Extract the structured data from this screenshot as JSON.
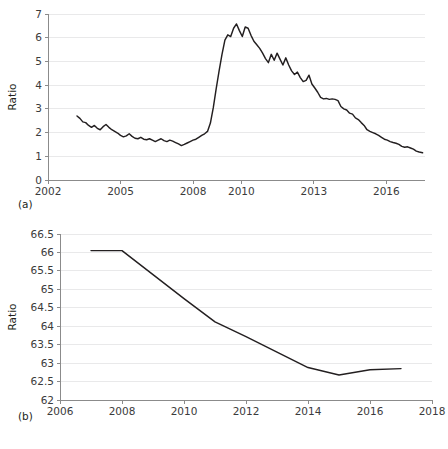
{
  "figure": {
    "background": "#ffffff",
    "line_color": "#231f20",
    "grid_color": "#e9e9ea",
    "axis_color": "#8b8b8b",
    "panel_a_label": "(a)",
    "panel_b_label": "(b)"
  },
  "chart_data": [
    {
      "id": "panel-a",
      "type": "line",
      "title": "",
      "xlabel": "",
      "ylabel": "Ratio",
      "grid": true,
      "legend": "none",
      "xlim": [
        2002,
        2017.6
      ],
      "ylim": [
        0,
        7
      ],
      "xticks": [
        2002,
        2005,
        2008,
        2010,
        2013,
        2016
      ],
      "xticklabels": [
        "2002",
        "2005",
        "2008",
        "2010",
        "2013",
        "2016"
      ],
      "yticks": [
        0,
        1,
        2,
        3,
        4,
        5,
        6,
        7
      ],
      "yticklabels": [
        "0",
        "1",
        "2",
        "3",
        "4",
        "5",
        "6",
        "7"
      ],
      "series": [
        {
          "name": "Ratio",
          "x": [
            2003.2,
            2003.32,
            2003.44,
            2003.56,
            2003.68,
            2003.8,
            2003.92,
            2004.04,
            2004.16,
            2004.28,
            2004.4,
            2004.52,
            2004.64,
            2004.76,
            2004.88,
            2005.0,
            2005.12,
            2005.24,
            2005.36,
            2005.48,
            2005.6,
            2005.72,
            2005.84,
            2005.96,
            2006.08,
            2006.2,
            2006.32,
            2006.44,
            2006.56,
            2006.68,
            2006.8,
            2006.92,
            2007.04,
            2007.16,
            2007.28,
            2007.4,
            2007.52,
            2007.64,
            2007.76,
            2007.88,
            2008.0,
            2008.12,
            2008.24,
            2008.36,
            2008.48,
            2008.6,
            2008.72,
            2008.84,
            2008.96,
            2009.08,
            2009.2,
            2009.32,
            2009.44,
            2009.56,
            2009.68,
            2009.8,
            2009.92,
            2010.04,
            2010.16,
            2010.28,
            2010.4,
            2010.52,
            2010.64,
            2010.76,
            2010.88,
            2011.0,
            2011.12,
            2011.24,
            2011.36,
            2011.48,
            2011.6,
            2011.72,
            2011.84,
            2011.96,
            2012.08,
            2012.2,
            2012.32,
            2012.44,
            2012.56,
            2012.68,
            2012.8,
            2012.92,
            2013.04,
            2013.16,
            2013.28,
            2013.4,
            2013.52,
            2013.64,
            2013.76,
            2013.88,
            2014.0,
            2014.12,
            2014.24,
            2014.36,
            2014.48,
            2014.6,
            2014.72,
            2014.84,
            2014.96,
            2015.08,
            2015.2,
            2015.32,
            2015.44,
            2015.56,
            2015.68,
            2015.8,
            2015.92,
            2016.04,
            2016.16,
            2016.28,
            2016.4,
            2016.52,
            2016.64,
            2016.76,
            2016.88,
            2017.0,
            2017.12,
            2017.24,
            2017.36,
            2017.5
          ],
          "y": [
            2.7,
            2.6,
            2.45,
            2.42,
            2.3,
            2.22,
            2.3,
            2.18,
            2.12,
            2.25,
            2.34,
            2.22,
            2.12,
            2.05,
            1.98,
            1.88,
            1.82,
            1.86,
            1.95,
            1.84,
            1.76,
            1.74,
            1.8,
            1.72,
            1.7,
            1.74,
            1.68,
            1.62,
            1.68,
            1.74,
            1.66,
            1.62,
            1.68,
            1.64,
            1.58,
            1.52,
            1.45,
            1.5,
            1.56,
            1.62,
            1.68,
            1.72,
            1.8,
            1.88,
            1.95,
            2.05,
            2.4,
            3.05,
            3.85,
            4.6,
            5.3,
            5.9,
            6.12,
            6.05,
            6.4,
            6.58,
            6.3,
            6.05,
            6.45,
            6.4,
            6.1,
            5.85,
            5.7,
            5.55,
            5.35,
            5.12,
            4.95,
            5.3,
            5.05,
            5.35,
            5.1,
            4.85,
            5.15,
            4.85,
            4.6,
            4.45,
            4.55,
            4.32,
            4.15,
            4.2,
            4.42,
            4.05,
            3.88,
            3.7,
            3.48,
            3.42,
            3.44,
            3.4,
            3.42,
            3.4,
            3.35,
            3.1,
            3.0,
            2.95,
            2.82,
            2.78,
            2.62,
            2.55,
            2.42,
            2.3,
            2.12,
            2.05,
            2.0,
            1.95,
            1.88,
            1.8,
            1.72,
            1.68,
            1.62,
            1.58,
            1.55,
            1.5,
            1.42,
            1.38,
            1.4,
            1.35,
            1.3,
            1.22,
            1.18,
            1.15
          ]
        }
      ]
    },
    {
      "id": "panel-b",
      "type": "line",
      "title": "",
      "xlabel": "",
      "ylabel": "Ratio",
      "grid": true,
      "legend": "none",
      "xlim": [
        2006,
        2018
      ],
      "ylim": [
        62,
        66.5
      ],
      "xticks": [
        2006,
        2008,
        2010,
        2012,
        2014,
        2016,
        2018
      ],
      "xticklabels": [
        "2006",
        "2008",
        "2010",
        "2012",
        "2014",
        "2016",
        "2018"
      ],
      "yticks": [
        62,
        62.5,
        63,
        63.5,
        64,
        64.5,
        65,
        65.5,
        66,
        66.5
      ],
      "yticklabels": [
        "62",
        "62.5",
        "63",
        "63.5",
        "64",
        "64.5",
        "65",
        "65.5",
        "66",
        "66.5"
      ],
      "series": [
        {
          "name": "Ratio",
          "x": [
            2007,
            2008,
            2009,
            2010,
            2011,
            2012,
            2013,
            2014,
            2015,
            2016,
            2017
          ],
          "y": [
            66.05,
            66.05,
            65.4,
            64.75,
            64.12,
            63.72,
            63.3,
            62.88,
            62.68,
            62.82,
            62.85
          ]
        }
      ]
    }
  ]
}
